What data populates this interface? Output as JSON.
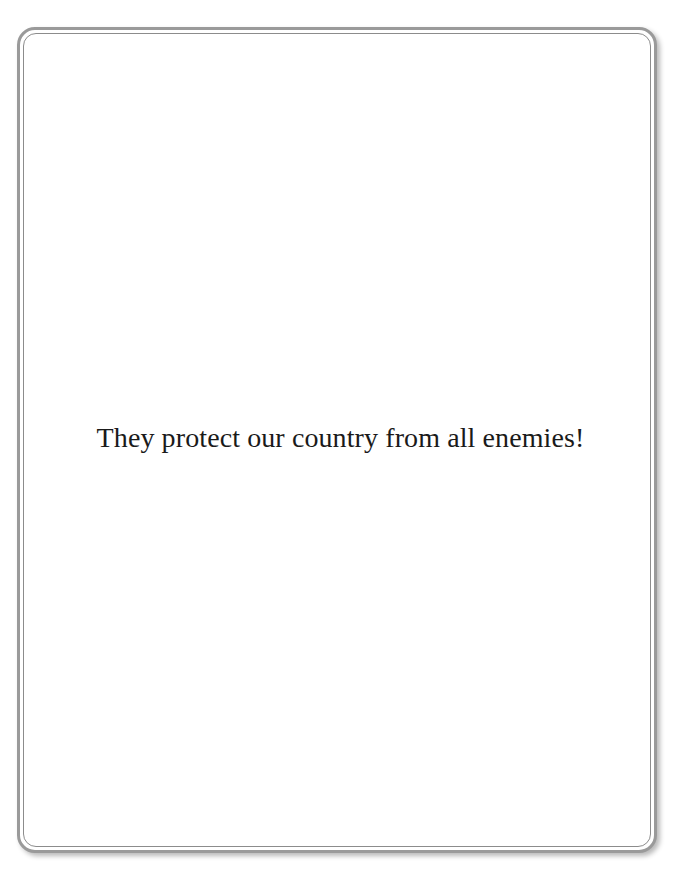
{
  "page": {
    "caption": "They protect our country from all enemies!",
    "colors": {
      "border": "#9a9a9a",
      "inner_border": "#8c8c8c",
      "text": "#1a1a1a",
      "background": "#ffffff"
    }
  }
}
